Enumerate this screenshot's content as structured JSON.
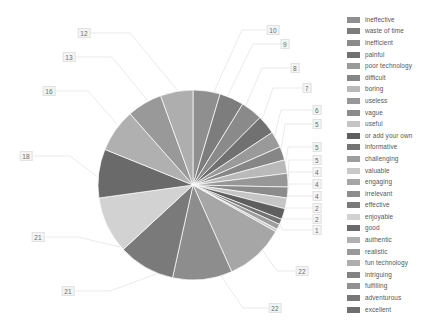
{
  "chart_data": {
    "type": "pie",
    "title": "",
    "subtitle": "",
    "xlabel": "",
    "ylabel": "",
    "grid": false,
    "legend_position": "right",
    "total": 206,
    "categories": [
      "ineffective",
      "waste of time",
      "inefficient",
      "painful",
      "poor technology",
      "difficult",
      "boring",
      "useless",
      "vague",
      "useful",
      "or add your own",
      "informative",
      "challenging",
      "valuable",
      "engaging",
      "irrelevant",
      "effective",
      "enjoyable",
      "good",
      "authentic",
      "realistic",
      "fun technology",
      "intriguing",
      "fulfilling",
      "adventurous",
      "excellent"
    ],
    "values": [
      10,
      9,
      8,
      7,
      6,
      5,
      5,
      5,
      4,
      4,
      4,
      2,
      2,
      1,
      22,
      22,
      21,
      21,
      18,
      16,
      13,
      12,
      0,
      0,
      0,
      0
    ],
    "slice_labels": [
      "10",
      "9",
      "8",
      "7",
      "6",
      "5",
      "5",
      "5",
      "4",
      "4",
      "4",
      "2",
      "2",
      "1",
      "22",
      "22",
      "21",
      "21",
      "18",
      "16",
      "13",
      "12"
    ],
    "colors": [
      "#8f8f8f",
      "#7d7d7d",
      "#8a8a8a",
      "#717171",
      "#9a9a9a",
      "#868686",
      "#b9b9b9",
      "#979797",
      "#8b8b8b",
      "#c5c5c5",
      "#5e5e5e",
      "#747474",
      "#9e9e9e",
      "#c9c9c9",
      "#a6a6a6",
      "#8d8d8d",
      "#7a7a7a",
      "#d2d2d2",
      "#6a6a6a",
      "#b0b0b0",
      "#999999",
      "#aeaeae",
      "#828282",
      "#909090",
      "#787878",
      "#6f6f6f"
    ]
  },
  "legend": {
    "items": [
      {
        "label": "ineffective",
        "color": "#8f8f8f"
      },
      {
        "label": "waste of time",
        "color": "#7d7d7d"
      },
      {
        "label": "inefficient",
        "color": "#8a8a8a"
      },
      {
        "label": "painful",
        "color": "#717171"
      },
      {
        "label": "poor technology",
        "color": "#9a9a9a"
      },
      {
        "label": "difficult",
        "color": "#868686"
      },
      {
        "label": "boring",
        "color": "#b9b9b9"
      },
      {
        "label": "useless",
        "color": "#979797"
      },
      {
        "label": "vague",
        "color": "#8b8b8b"
      },
      {
        "label": "useful",
        "color": "#c5c5c5"
      },
      {
        "label": "or add your own",
        "color": "#5e5e5e"
      },
      {
        "label": "informative",
        "color": "#747474"
      },
      {
        "label": "challenging",
        "color": "#9e9e9e"
      },
      {
        "label": "valuable",
        "color": "#c9c9c9"
      },
      {
        "label": "engaging",
        "color": "#a6a6a6"
      },
      {
        "label": "irrelevant",
        "color": "#8d8d8d"
      },
      {
        "label": "effective",
        "color": "#7a7a7a"
      },
      {
        "label": "enjoyable",
        "color": "#d2d2d2"
      },
      {
        "label": "good",
        "color": "#6a6a6a"
      },
      {
        "label": "authentic",
        "color": "#b0b0b0"
      },
      {
        "label": "realistic",
        "color": "#999999"
      },
      {
        "label": "fun technology",
        "color": "#aeaeae"
      },
      {
        "label": "intriguing",
        "color": "#828282"
      },
      {
        "label": "fulfilling",
        "color": "#909090"
      },
      {
        "label": "adventurous",
        "color": "#787878"
      },
      {
        "label": "excellent",
        "color": "#6f6f6f"
      }
    ]
  },
  "pie_geometry": {
    "cx": 193,
    "cy": 185,
    "r": 95,
    "start_angle_deg": -90,
    "slices": [
      {
        "value": 10,
        "color": "#8f8f8f",
        "label": "10",
        "label_x": 273,
        "label_y": 30,
        "elbow_x": 242,
        "elbow_y": 30,
        "anchor_x": 213,
        "anchor_y": 94
      },
      {
        "value": 9,
        "color": "#7d7d7d",
        "label": "9",
        "label_x": 285,
        "label_y": 44,
        "elbow_x": 253,
        "elbow_y": 44,
        "anchor_x": 226,
        "anchor_y": 99
      },
      {
        "value": 8,
        "color": "#8a8a8a",
        "label": "8",
        "label_x": 295,
        "label_y": 68,
        "elbow_x": 262,
        "elbow_y": 68,
        "anchor_x": 243,
        "anchor_y": 112
      },
      {
        "value": 7,
        "color": "#717171",
        "label": "7",
        "label_x": 307,
        "label_y": 88,
        "elbow_x": 273,
        "elbow_y": 88,
        "anchor_x": 259,
        "anchor_y": 128
      },
      {
        "value": 6,
        "color": "#9a9a9a",
        "label": "6",
        "label_x": 317,
        "label_y": 110,
        "elbow_x": 281,
        "elbow_y": 110,
        "anchor_x": 272,
        "anchor_y": 146
      },
      {
        "value": 5,
        "color": "#868686",
        "label": "5",
        "label_x": 317,
        "label_y": 124,
        "elbow_x": 285,
        "elbow_y": 124,
        "anchor_x": 280,
        "anchor_y": 157
      },
      {
        "value": 5,
        "color": "#b9b9b9",
        "label": "5",
        "label_x": 317,
        "label_y": 147,
        "elbow_x": 288,
        "elbow_y": 147,
        "anchor_x": 285,
        "anchor_y": 167
      },
      {
        "value": 5,
        "color": "#979797",
        "label": "5",
        "label_x": 317,
        "label_y": 160,
        "elbow_x": 289,
        "elbow_y": 160,
        "anchor_x": 288,
        "anchor_y": 176
      },
      {
        "value": 4,
        "color": "#8b8b8b",
        "label": "4",
        "label_x": 317,
        "label_y": 172,
        "elbow_x": 289,
        "elbow_y": 172,
        "anchor_x": 288,
        "anchor_y": 184
      },
      {
        "value": 4,
        "color": "#c5c5c5",
        "label": "4",
        "label_x": 317,
        "label_y": 184,
        "elbow_x": 289,
        "elbow_y": 184,
        "anchor_x": 288,
        "anchor_y": 191
      },
      {
        "value": 4,
        "color": "#5e5e5e",
        "label": "4",
        "label_x": 317,
        "label_y": 196,
        "elbow_x": 288,
        "elbow_y": 196,
        "anchor_x": 286,
        "anchor_y": 199
      },
      {
        "value": 2,
        "color": "#747474",
        "label": "2",
        "label_x": 317,
        "label_y": 208,
        "elbow_x": 286,
        "elbow_y": 208,
        "anchor_x": 283,
        "anchor_y": 205
      },
      {
        "value": 2,
        "color": "#9e9e9e",
        "label": "2",
        "label_x": 317,
        "label_y": 219,
        "elbow_x": 284,
        "elbow_y": 219,
        "anchor_x": 280,
        "anchor_y": 210
      },
      {
        "value": 1,
        "color": "#c9c9c9",
        "label": "1",
        "label_x": 317,
        "label_y": 230,
        "elbow_x": 282,
        "elbow_y": 230,
        "anchor_x": 277,
        "anchor_y": 214
      },
      {
        "value": 22,
        "color": "#a6a6a6",
        "label": "22",
        "label_x": 302,
        "label_y": 271,
        "elbow_x": 277,
        "elbow_y": 271,
        "anchor_x": 259,
        "anchor_y": 245
      },
      {
        "value": 22,
        "color": "#8d8d8d",
        "label": "22",
        "label_x": 275,
        "label_y": 308,
        "elbow_x": 243,
        "elbow_y": 308,
        "anchor_x": 221,
        "anchor_y": 276
      },
      {
        "value": 21,
        "color": "#7a7a7a",
        "label": "21",
        "label_x": 68,
        "label_y": 291,
        "elbow_x": 110,
        "elbow_y": 291,
        "anchor_x": 159,
        "anchor_y": 273
      },
      {
        "value": 21,
        "color": "#d2d2d2",
        "label": "21",
        "label_x": 38,
        "label_y": 237,
        "elbow_x": 78,
        "elbow_y": 237,
        "anchor_x": 120,
        "anchor_y": 247
      },
      {
        "value": 18,
        "color": "#6a6a6a",
        "label": "18",
        "label_x": 26,
        "label_y": 156,
        "elbow_x": 70,
        "elbow_y": 156,
        "anchor_x": 99,
        "anchor_y": 178
      },
      {
        "value": 16,
        "color": "#b0b0b0",
        "label": "16",
        "label_x": 49,
        "label_y": 91,
        "elbow_x": 88,
        "elbow_y": 91,
        "anchor_x": 117,
        "anchor_y": 124
      },
      {
        "value": 13,
        "color": "#999999",
        "label": "13",
        "label_x": 69,
        "label_y": 57,
        "elbow_x": 112,
        "elbow_y": 57,
        "anchor_x": 147,
        "anchor_y": 100
      },
      {
        "value": 12,
        "color": "#aeaeae",
        "label": "12",
        "label_x": 84,
        "label_y": 33,
        "elbow_x": 130,
        "elbow_y": 33,
        "anchor_x": 178,
        "anchor_y": 91
      }
    ]
  }
}
